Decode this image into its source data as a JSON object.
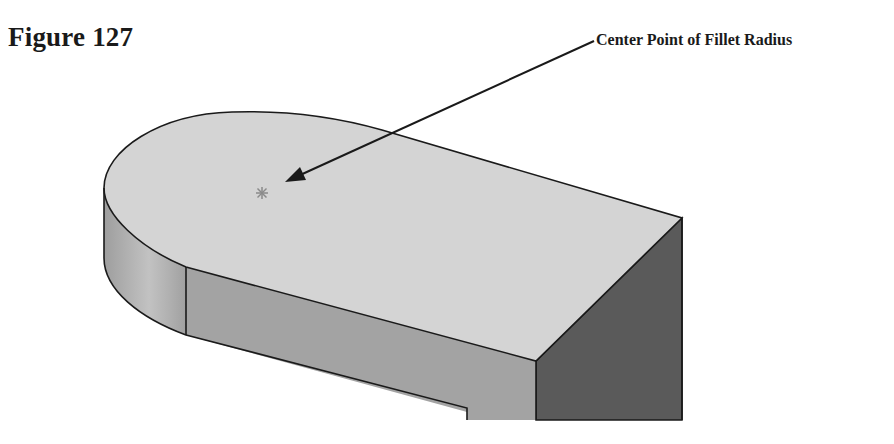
{
  "figure": {
    "title": "Figure 127",
    "callout": {
      "label": "Center Point of Fillet Radius",
      "target": "fillet-center-point"
    }
  },
  "colors": {
    "top_face": "#d4d4d4",
    "fillet_side": "#a9a9a9",
    "front_face": "#a2a2a2",
    "right_face": "#5a5a5a",
    "edge": "#1a1a1a",
    "center_mark": "#8a8a8a",
    "text": "#1a1a1a"
  }
}
